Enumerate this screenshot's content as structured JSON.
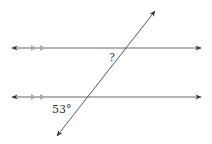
{
  "diagram": {
    "type": "parallel-lines-transversal",
    "colors": {
      "line": "#444444",
      "tick": "#aaaaaa",
      "label": "#333333",
      "background": "#ffffff"
    },
    "parallel_lines": [
      {
        "name": "top-line",
        "y": 48,
        "x1": 12,
        "x2": 201,
        "tick_marks": 2
      },
      {
        "name": "bottom-line",
        "y": 97,
        "x1": 12,
        "x2": 201,
        "tick_marks": 2
      }
    ],
    "transversal": {
      "x1": 57,
      "y1": 136,
      "x2": 155,
      "y2": 11
    },
    "labels": {
      "unknown_angle": "?",
      "given_angle": "53°"
    },
    "given_angle_value": 53,
    "given_angle_unit": "degrees"
  }
}
